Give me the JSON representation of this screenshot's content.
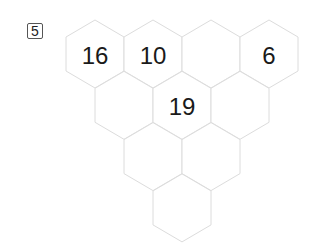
{
  "puzzle": {
    "number": "5",
    "rows": [
      [
        "16",
        "10",
        "",
        "6"
      ],
      [
        "",
        "19",
        ""
      ],
      [
        "",
        ""
      ],
      [
        ""
      ]
    ]
  }
}
